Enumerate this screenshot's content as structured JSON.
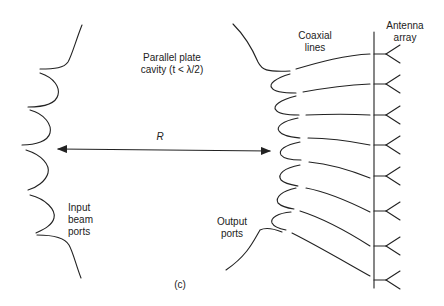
{
  "labels": {
    "cavity_line1": "Parallel plate",
    "cavity_line2": "cavity (t < λ/2)",
    "coax_line1": "Coaxial",
    "coax_line2": "lines",
    "antenna_line1": "Antenna",
    "antenna_line2": "array",
    "distance": "R",
    "input_line1": "Input",
    "input_line2": "beam",
    "input_line3": "ports",
    "output_line1": "Output",
    "output_line2": "ports",
    "figure_tag": "(c)"
  },
  "geometry": {
    "antenna_feed_x": 374,
    "antenna_y": [
      54,
      84,
      115,
      145,
      176,
      211,
      246,
      280
    ],
    "input_port_count": 5,
    "output_port_count": 8
  },
  "colors": {
    "stroke": "#222222",
    "background": "#ffffff"
  }
}
